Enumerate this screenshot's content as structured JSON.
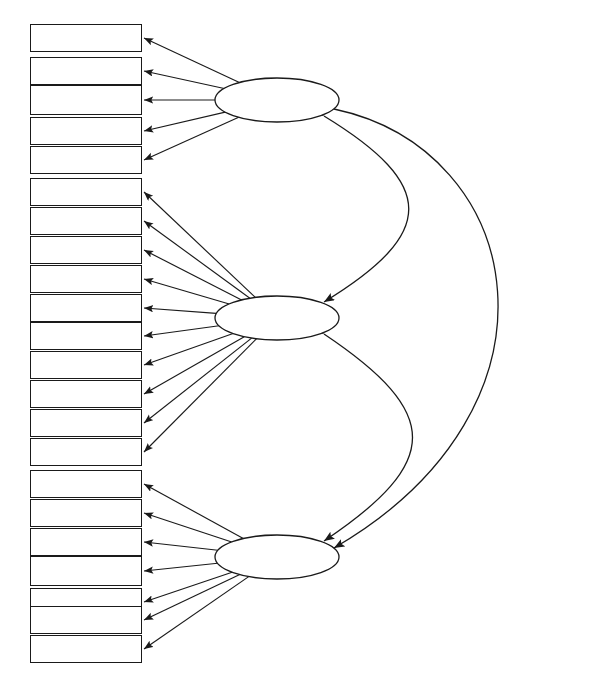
{
  "diagram": {
    "type": "path-diagram",
    "title": "",
    "indicator_count": 22,
    "factor_count": 3,
    "stroke_color": "#1a1a1a",
    "background_color": "#ffffff"
  },
  "factors": [
    {
      "id": "f1",
      "label": "創新啟動力",
      "cx": 277,
      "cy": 100,
      "rx": 62,
      "ry": 22,
      "font_size": 15
    },
    {
      "id": "f2",
      "label": "創新助動力",
      "cx": 277,
      "cy": 318,
      "rx": 62,
      "ry": 22,
      "font_size": 15
    },
    {
      "id": "f3",
      "label": "創新行動力",
      "cx": 277,
      "cy": 557,
      "rx": 62,
      "ry": 22,
      "font_size": 15
    }
  ],
  "indicators": [
    {
      "label": "好奇敏感",
      "factor": "f1",
      "x": 30,
      "y": 24,
      "w": 112,
      "h": 28,
      "font_size": 17,
      "bold": false
    },
    {
      "label": "保持激情",
      "factor": "f1",
      "x": 30,
      "y": 57,
      "w": 112,
      "h": 28,
      "font_size": 17,
      "bold": false
    },
    {
      "label": "善於思考",
      "factor": "f1",
      "x": 30,
      "y": 85,
      "w": 112,
      "h": 30,
      "font_size": 19,
      "bold": true
    },
    {
      "label": "成就動機",
      "factor": "f1",
      "x": 30,
      "y": 117,
      "w": 112,
      "h": 28,
      "font_size": 17,
      "bold": false
    },
    {
      "label": "興趣驅動",
      "factor": "f1",
      "x": 30,
      "y": 146,
      "w": 112,
      "h": 28,
      "font_size": 17,
      "bold": false
    },
    {
      "label": "勤勉敬業",
      "factor": "f2",
      "x": 30,
      "y": 178,
      "w": 112,
      "h": 28,
      "font_size": 17,
      "bold": false
    },
    {
      "label": "開放包容",
      "factor": "f2",
      "x": 30,
      "y": 207,
      "w": 112,
      "h": 28,
      "font_size": 17,
      "bold": false
    },
    {
      "label": "盡職盡責",
      "factor": "f2",
      "x": 30,
      "y": 236,
      "w": 112,
      "h": 28,
      "font_size": 17,
      "bold": false
    },
    {
      "label": "積極主動",
      "factor": "f2",
      "x": 30,
      "y": 265,
      "w": 112,
      "h": 28,
      "font_size": 17,
      "bold": false
    },
    {
      "label": "溝通協作",
      "factor": "f2",
      "x": 30,
      "y": 294,
      "w": 112,
      "h": 28,
      "font_size": 17,
      "bold": false
    },
    {
      "label": "影響感召",
      "factor": "f2",
      "x": 30,
      "y": 322,
      "w": 112,
      "h": 28,
      "font_size": 17,
      "bold": false
    },
    {
      "label": "客戶導向",
      "factor": "f2",
      "x": 30,
      "y": 351,
      "w": 112,
      "h": 28,
      "font_size": 17,
      "bold": false
    },
    {
      "label": "精益求精",
      "factor": "f2",
      "x": 30,
      "y": 380,
      "w": 112,
      "h": 28,
      "font_size": 17,
      "bold": false
    },
    {
      "label": "堅韌執著",
      "factor": "f2",
      "x": 30,
      "y": 409,
      "w": 112,
      "h": 28,
      "font_size": 17,
      "bold": false
    },
    {
      "label": "時間觀念",
      "factor": "f2",
      "x": 30,
      "y": 438,
      "w": 112,
      "h": 28,
      "font_size": 17,
      "bold": false
    },
    {
      "label": "開拓突破",
      "factor": "f3",
      "x": 30,
      "y": 470,
      "w": 112,
      "h": 28,
      "font_size": 17,
      "bold": false
    },
    {
      "label": "規劃設計",
      "factor": "f3",
      "x": 30,
      "y": 499,
      "w": 112,
      "h": 28,
      "font_size": 17,
      "bold": false
    },
    {
      "label": "探索鑽研",
      "factor": "f3",
      "x": 30,
      "y": 528,
      "w": 112,
      "h": 28,
      "font_size": 17,
      "bold": false
    },
    {
      "label": "追蹤前沿",
      "factor": "f3",
      "x": 30,
      "y": 556,
      "w": 112,
      "h": 30,
      "font_size": 19,
      "bold": true
    },
    {
      "label": "實踐操作",
      "factor": "f3",
      "x": 30,
      "y": 588,
      "w": 112,
      "h": 28,
      "font_size": 17,
      "bold": false
    },
    {
      "label": "應變把控",
      "factor": "f3",
      "x": 30,
      "y": 606,
      "w": 112,
      "h": 28,
      "font_size": 17,
      "bold": false
    },
    {
      "label": "組織管理",
      "factor": "f3",
      "x": 30,
      "y": 635,
      "w": 112,
      "h": 28,
      "font_size": 17,
      "bold": false
    }
  ],
  "correlations": [
    {
      "from": "f1",
      "to": "f2",
      "style": "inner-arc",
      "bidirectional": true
    },
    {
      "from": "f2",
      "to": "f3",
      "style": "inner-arc",
      "bidirectional": true
    },
    {
      "from": "f1",
      "to": "f3",
      "style": "outer-arc",
      "bidirectional": true
    }
  ]
}
